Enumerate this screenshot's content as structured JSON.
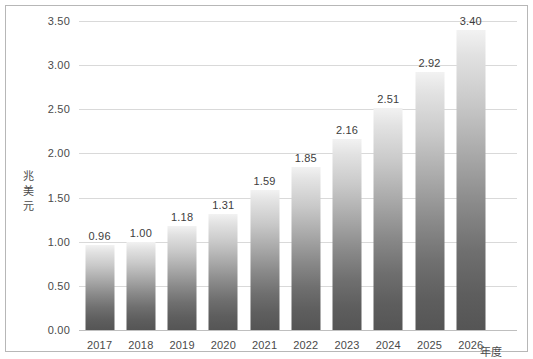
{
  "chart_data": {
    "type": "bar",
    "title": "",
    "subtitle": "",
    "xlabel": "年度",
    "ylabel": "兆美元",
    "categories": [
      "2017",
      "2018",
      "2019",
      "2020",
      "2021",
      "2022",
      "2023",
      "2024",
      "2025",
      "2026"
    ],
    "values": [
      0.96,
      1.0,
      1.18,
      1.31,
      1.59,
      1.85,
      2.16,
      2.51,
      2.92,
      3.4
    ],
    "value_labels": [
      "0.96",
      "1.00",
      "1.18",
      "1.31",
      "1.59",
      "1.85",
      "2.16",
      "2.51",
      "2.92",
      "3.40"
    ],
    "ylim": [
      0.0,
      3.5
    ],
    "ytick_labels": [
      "0.00",
      "0.50",
      "1.00",
      "1.50",
      "2.00",
      "2.50",
      "3.00",
      "3.50"
    ],
    "ytick_values": [
      0.0,
      0.5,
      1.0,
      1.5,
      2.0,
      2.5,
      3.0,
      3.5
    ],
    "grid": true,
    "legend": false,
    "legend_position": "none",
    "series": [
      {
        "name": "",
        "values": [
          0.96,
          1.0,
          1.18,
          1.31,
          1.59,
          1.85,
          2.16,
          2.51,
          2.92,
          3.4
        ]
      }
    ],
    "colors": {
      "bar_top": "#f2f2f2",
      "bar_bottom": "#555555",
      "gridline": "#d9d9d9",
      "axis": "#bfbfbf",
      "border": "#b7b7b7",
      "background": "#ffffff",
      "text": "#4a4a4a"
    }
  }
}
